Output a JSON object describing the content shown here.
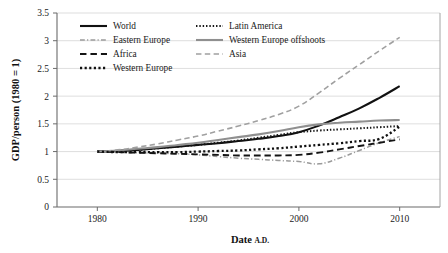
{
  "chart_data": {
    "type": "line",
    "title": "",
    "xlabel": "Date A.D.",
    "xlabel_main": "Date ",
    "xlabel_smallcaps": "A.D.",
    "ylabel": "GDP/person (1980 = 1)",
    "xlim": [
      1976,
      2014
    ],
    "ylim": [
      0,
      3.5
    ],
    "xticks": [
      "1980",
      "1990",
      "2000",
      "2010"
    ],
    "xtick_values": [
      1980,
      1990,
      2000,
      2010
    ],
    "yticks": [
      "0",
      "0.5",
      "1",
      "1.5",
      "2",
      "2.5",
      "3",
      "3.5"
    ],
    "ytick_values": [
      0,
      0.5,
      1,
      1.5,
      2,
      2.5,
      3,
      3.5
    ],
    "grid": "horizontal",
    "legend_position": "upper-left-inside",
    "legend_columns": 2,
    "x": [
      1980,
      1982,
      1984,
      1986,
      1988,
      1990,
      1992,
      1994,
      1996,
      1998,
      2000,
      2002,
      2004,
      2006,
      2008,
      2010
    ],
    "series": [
      {
        "name": "World",
        "style": "solid",
        "color": "#111111",
        "width": 2.1,
        "values": [
          1.0,
          1.01,
          1.03,
          1.06,
          1.09,
          1.12,
          1.15,
          1.19,
          1.23,
          1.28,
          1.35,
          1.47,
          1.62,
          1.78,
          1.97,
          2.18
        ]
      },
      {
        "name": "Latin America",
        "style": "fine-dotted",
        "color": "#161616",
        "width": 2.0,
        "values": [
          1.0,
          1.01,
          1.03,
          1.06,
          1.09,
          1.12,
          1.16,
          1.2,
          1.25,
          1.3,
          1.35,
          1.38,
          1.4,
          1.42,
          1.44,
          1.46
        ]
      },
      {
        "name": "Eastern Europe",
        "style": "dash-dot",
        "color": "#9a9a9a",
        "width": 1.5,
        "values": [
          1.0,
          0.99,
          0.98,
          0.97,
          0.96,
          0.94,
          0.91,
          0.88,
          0.86,
          0.84,
          0.82,
          0.78,
          0.88,
          1.02,
          1.16,
          1.27
        ]
      },
      {
        "name": "Western Europe offshoots",
        "style": "solid",
        "color": "#8f8f8f",
        "width": 2.1,
        "values": [
          1.0,
          1.02,
          1.05,
          1.08,
          1.12,
          1.16,
          1.21,
          1.26,
          1.31,
          1.37,
          1.44,
          1.49,
          1.52,
          1.54,
          1.56,
          1.57
        ]
      },
      {
        "name": "Africa",
        "style": "long-dash",
        "color": "#141414",
        "width": 1.9,
        "values": [
          1.0,
          0.99,
          0.98,
          0.97,
          0.96,
          0.95,
          0.94,
          0.93,
          0.93,
          0.93,
          0.94,
          0.98,
          1.04,
          1.1,
          1.16,
          1.22
        ]
      },
      {
        "name": "Asia",
        "style": "long-dash",
        "color": "#a0a0a0",
        "width": 1.6,
        "values": [
          1.0,
          1.03,
          1.08,
          1.14,
          1.21,
          1.28,
          1.37,
          1.46,
          1.56,
          1.67,
          1.82,
          2.06,
          2.32,
          2.57,
          2.82,
          3.06
        ]
      },
      {
        "name": "Western Europe",
        "style": "square-dotted",
        "color": "#111111",
        "width": 2.3,
        "values": [
          1.0,
          0.99,
          0.99,
          0.99,
          0.99,
          1.0,
          1.01,
          1.02,
          1.04,
          1.06,
          1.09,
          1.12,
          1.15,
          1.19,
          1.23,
          1.45
        ]
      }
    ],
    "legend_order": [
      "World",
      "Latin America",
      "Eastern Europe",
      "Western Europe offshoots",
      "Africa",
      "Asia",
      "Western Europe"
    ]
  }
}
